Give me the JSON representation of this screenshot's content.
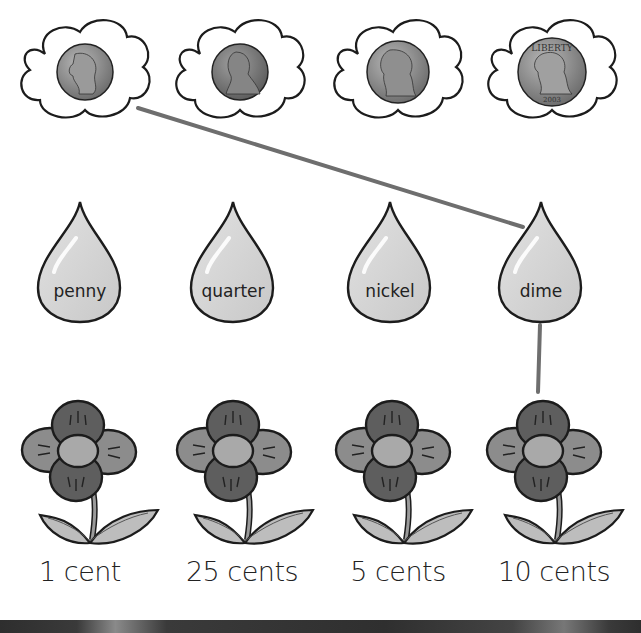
{
  "worksheet": {
    "type": "coin matching activity",
    "coins": [
      {
        "name": "dime-coin",
        "text": "LIBERTY",
        "color": "#8e8e8e"
      },
      {
        "name": "penny-coin",
        "text": "LIBERTY",
        "color": "#7a7a7a"
      },
      {
        "name": "nickel-coin",
        "text": "",
        "color": "#7e7e7e"
      },
      {
        "name": "quarter-coin",
        "text": "LIBERTY",
        "year": "2003",
        "color": "#9a9a9a"
      }
    ],
    "drops": [
      {
        "label": "penny"
      },
      {
        "label": "quarter"
      },
      {
        "label": "nickel"
      },
      {
        "label": "dime"
      }
    ],
    "values": [
      {
        "label": "1 cent"
      },
      {
        "label": "25 cents"
      },
      {
        "label": "5 cents"
      },
      {
        "label": "10 cents"
      }
    ],
    "connections": [
      {
        "from": "coin-1 (dime)",
        "to": "drop-4 (dime)"
      },
      {
        "from": "drop-4 (dime)",
        "to": "flower-4 (10 cents)"
      }
    ]
  },
  "colors": {
    "line": "#6e6e6e",
    "drop_fill": "#d2d2d2",
    "petal_dark": "#5e5e5e",
    "petal_light": "#8c8c8c",
    "flower_center": "#a9a9a9",
    "leaf": "#bdbdbd",
    "outline": "#1c1c1c"
  }
}
